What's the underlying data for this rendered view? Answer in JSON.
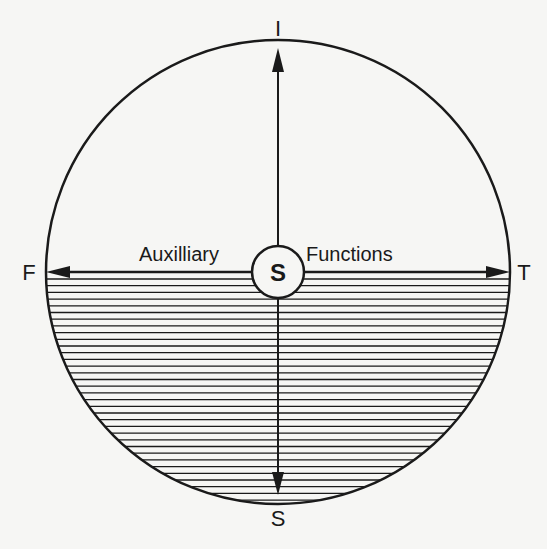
{
  "diagram": {
    "poles": {
      "top": "I",
      "bottom": "S",
      "left": "F",
      "right": "T"
    },
    "center_label": "S",
    "axis_labels": {
      "left": "Auxilliary",
      "right": "Functions"
    },
    "colors": {
      "background": "#f6f6f4",
      "ink": "#1a1a1a"
    }
  }
}
